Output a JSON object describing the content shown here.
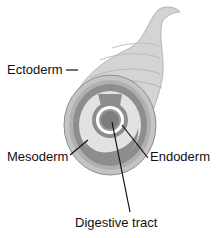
{
  "diagram": {
    "labels": {
      "ectoderm": "Ectoderm",
      "mesoderm": "Mesoderm",
      "endoderm": "Endoderm",
      "digestive_tract": "Digestive tract"
    },
    "colors": {
      "outer_body": "#c9c9c9",
      "outer_ring": "#a8a8a8",
      "mesoderm": "#8a8a8a",
      "cavity": "#dcdcdc",
      "endoderm_ring": "#ffffff",
      "tract": "#7d7d7d",
      "line": "#111111"
    }
  }
}
